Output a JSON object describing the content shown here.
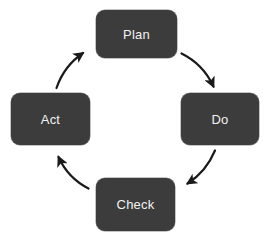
{
  "diagram": {
    "name": "PDCA Cycle",
    "type": "cycle",
    "direction": "clockwise",
    "background_color": "#ffffff",
    "node_color": "#3c3c3c",
    "node_text_color": "#f2f2f2",
    "arrow_color": "#1a1a1a",
    "nodes": [
      {
        "id": "plan",
        "label": "Plan",
        "position": "top"
      },
      {
        "id": "do",
        "label": "Do",
        "position": "right"
      },
      {
        "id": "check",
        "label": "Check",
        "position": "bottom"
      },
      {
        "id": "act",
        "label": "Act",
        "position": "left"
      }
    ],
    "arrows": [
      {
        "id": "plan-to-do",
        "from": "plan",
        "to": "do",
        "position": "top-right"
      },
      {
        "id": "do-to-check",
        "from": "do",
        "to": "check",
        "position": "bottom-right"
      },
      {
        "id": "check-to-act",
        "from": "check",
        "to": "act",
        "position": "bottom-left"
      },
      {
        "id": "act-to-plan",
        "from": "act",
        "to": "plan",
        "position": "top-left"
      }
    ]
  }
}
